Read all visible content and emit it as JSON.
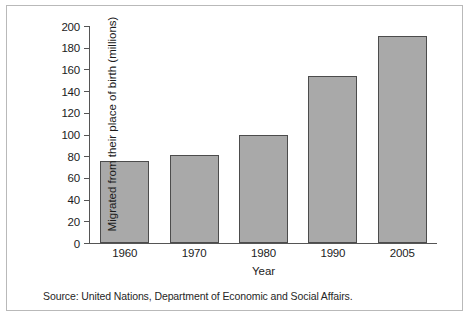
{
  "figure": {
    "source_note": "Source: United Nations, Department of Economic and Social Affairs."
  },
  "chart_data": {
    "type": "bar",
    "title": "",
    "xlabel": "Year",
    "ylabel": "Migrated from their place of birth (millions)",
    "categories": [
      "1960",
      "1970",
      "1980",
      "1990",
      "2005"
    ],
    "values": [
      76,
      81,
      100,
      154,
      191
    ],
    "ylim": [
      0,
      200
    ],
    "yticks": [
      0,
      20,
      40,
      60,
      80,
      100,
      120,
      140,
      160,
      180,
      200
    ],
    "ytick_labels": [
      "0",
      "20",
      "40",
      "60",
      "80",
      "100",
      "120",
      "140",
      "160",
      "180",
      "200"
    ],
    "grid": false,
    "legend": null,
    "bar_color": "#a9a9a9",
    "bar_edge_color": "#4c4c4c",
    "axis_color": "#555555",
    "text_color": "#1c1c1c"
  }
}
